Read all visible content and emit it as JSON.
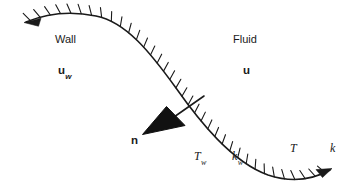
{
  "figure": {
    "background_color": "#ffffff",
    "line_color": "#1a1a1a",
    "canvas": {
      "width": 349,
      "height": 193
    }
  },
  "labels": {
    "wall": "Wall",
    "fluid": "Fluid",
    "wall_velocity": "u",
    "wall_velocity_sub": "w",
    "fluid_velocity": "u",
    "normal": "n",
    "wall_temperature": "T",
    "wall_temperature_sub": "w",
    "wall_conductivity": "k",
    "wall_conductivity_sub": "w",
    "fluid_temperature": "T",
    "fluid_conductivity": "k"
  },
  "geometry": {
    "interface_curve": "M 26 22 C 50 12, 72 11, 96 16 C 126 22, 150 52, 176 88 C 200 122, 232 162, 268 175 C 292 183, 312 180, 330 170",
    "normal_line": {
      "x1": 204,
      "y1": 97,
      "x2": 160,
      "y2": 126
    },
    "normal_arrowhead": "M 143 133 L 184 124 L 168 108 Z",
    "hatch_count": 36,
    "hatch_length": 9,
    "hatch_side": "fluid",
    "end_arrow_left": "M 26 22 L 40 19 L 36 26 Z",
    "end_arrow_right": "M 330 170 L 318 169 L 324 177 Z"
  },
  "chart_data": {
    "type": "line",
    "series": [
      {
        "name": "interface",
        "x": [
          26,
          50,
          72,
          96,
          126,
          150,
          176,
          200,
          232,
          268,
          292,
          312,
          330
        ],
        "y": [
          22,
          14,
          11,
          16,
          24,
          52,
          88,
          122,
          162,
          175,
          183,
          180,
          170
        ]
      }
    ],
    "annotations": [
      {
        "text": "Wall",
        "x": 55,
        "y": 34
      },
      {
        "text": "u_w",
        "x": 58,
        "y": 65
      },
      {
        "text": "Fluid",
        "x": 233,
        "y": 34
      },
      {
        "text": "u",
        "x": 243,
        "y": 65
      },
      {
        "text": "n",
        "x": 131,
        "y": 135
      },
      {
        "text": "T_w",
        "x": 194,
        "y": 150
      },
      {
        "text": "k_w",
        "x": 232,
        "y": 150
      },
      {
        "text": "T",
        "x": 290,
        "y": 142
      },
      {
        "text": "k",
        "x": 330,
        "y": 142
      }
    ],
    "xlabel": "",
    "ylabel": "",
    "grid": false,
    "legend": "none"
  }
}
